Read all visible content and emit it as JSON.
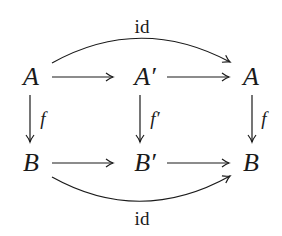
{
  "diagram": {
    "type": "commutative-diagram",
    "nodes": {
      "top_left": "A",
      "top_mid": "A′",
      "top_right": "A",
      "bot_left": "B",
      "bot_mid": "B′",
      "bot_right": "B"
    },
    "edges": {
      "top_arc_label": "id",
      "bot_arc_label": "id",
      "left_vertical_label": "f",
      "mid_vertical_label": "f′",
      "right_vertical_label": "f"
    },
    "colors": {
      "ink": "#1a1a1a",
      "background": "#ffffff"
    }
  }
}
